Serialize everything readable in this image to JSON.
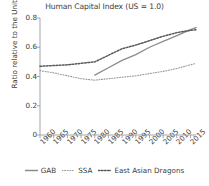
{
  "chart_data": {
    "type": "line",
    "title": "Human Capital Index (US = 1.0)",
    "xlabel": "",
    "ylabel": "Ratio relative to the United States",
    "xlim": [
      1960,
      2017
    ],
    "ylim": [
      0,
      0.8
    ],
    "grid": false,
    "legend_position": "bottom",
    "yticks": [
      "0",
      "0.2",
      "0.4",
      "0.6",
      "0.8"
    ],
    "ytick_values": [
      0,
      0.2,
      0.4,
      0.6,
      0.8
    ],
    "xticks": [
      "1960",
      "1965",
      "1970",
      "1975",
      "1980",
      "1985",
      "1990",
      "1995",
      "2000",
      "2005",
      "2010",
      "2015"
    ],
    "xtick_values": [
      1960,
      1965,
      1970,
      1975,
      1980,
      1985,
      1990,
      1995,
      2000,
      2005,
      2010,
      2015
    ],
    "series": [
      {
        "name": "GAB",
        "style": "solid",
        "color": "#8c8c8c",
        "x": [
          1980,
          1985,
          1990,
          1995,
          2000,
          2005,
          2010,
          2015,
          2017
        ],
        "values": [
          0.41,
          0.46,
          0.51,
          0.55,
          0.6,
          0.64,
          0.68,
          0.72,
          0.735
        ]
      },
      {
        "name": "SSA",
        "style": "dotted-fine",
        "color": "#9a9a9a",
        "x": [
          1960,
          1965,
          1970,
          1975,
          1980,
          1985,
          1990,
          1995,
          2000,
          2005,
          2010,
          2015,
          2017
        ],
        "values": [
          0.44,
          0.425,
          0.405,
          0.385,
          0.375,
          0.385,
          0.395,
          0.405,
          0.42,
          0.435,
          0.455,
          0.48,
          0.49
        ]
      },
      {
        "name": "East Asian Dragons",
        "style": "dotted",
        "color": "#5a5a5a",
        "x": [
          1960,
          1965,
          1970,
          1975,
          1980,
          1985,
          1990,
          1995,
          2000,
          2005,
          2010,
          2015,
          2017
        ],
        "values": [
          0.47,
          0.475,
          0.48,
          0.49,
          0.5,
          0.545,
          0.59,
          0.615,
          0.645,
          0.675,
          0.7,
          0.715,
          0.72
        ]
      }
    ]
  },
  "legend": {
    "items": [
      {
        "label": "GAB"
      },
      {
        "label": "SSA"
      },
      {
        "label": "East Asian Dragons"
      }
    ]
  },
  "colors": {
    "axis": "#9b9b9b",
    "text": "#3c3c3c",
    "background": "#ffffff"
  }
}
